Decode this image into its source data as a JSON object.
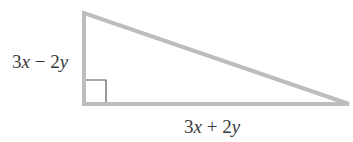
{
  "diagram": {
    "type": "right-triangle",
    "colors": {
      "stroke": "#bdbdbd",
      "right_angle_marker": "#555555",
      "text": "#3a3a3a",
      "background": "#ffffff"
    },
    "vertices": {
      "top": [
        84,
        13
      ],
      "right_angle": [
        84,
        104
      ],
      "right": [
        349,
        104
      ]
    },
    "labels": {
      "vertical_leg": {
        "coef1": "3",
        "var1": "x",
        "op": " − ",
        "coef2": "2",
        "var2": "y",
        "full": "3x − 2y"
      },
      "horizontal_leg": {
        "coef1": "3",
        "var1": "x",
        "op": " + ",
        "coef2": "2",
        "var2": "y",
        "full": "3x + 2y"
      }
    },
    "right_angle_marker": true
  }
}
